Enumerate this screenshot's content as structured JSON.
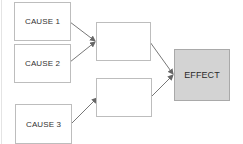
{
  "diagram": {
    "type": "cause-effect flow",
    "nodes": [
      {
        "id": "cause1",
        "label": "CAUSE 1"
      },
      {
        "id": "cause2",
        "label": "CAUSE 2"
      },
      {
        "id": "cause3",
        "label": "CAUSE 3"
      },
      {
        "id": "intermediate1",
        "label": ""
      },
      {
        "id": "intermediate2",
        "label": ""
      },
      {
        "id": "effect",
        "label": "EFFECT"
      }
    ],
    "edges": [
      {
        "from": "cause1",
        "to": "intermediate1"
      },
      {
        "from": "cause2",
        "to": "intermediate1"
      },
      {
        "from": "cause3",
        "to": "intermediate2"
      },
      {
        "from": "intermediate1",
        "to": "effect"
      },
      {
        "from": "intermediate2",
        "to": "effect"
      }
    ],
    "colors": {
      "box_border": "#bdbdbd",
      "effect_fill": "#d3d3d3",
      "arrow": "#666666"
    }
  }
}
